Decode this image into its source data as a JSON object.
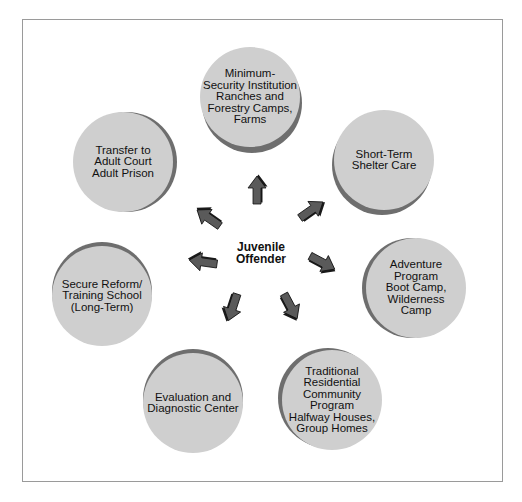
{
  "center": {
    "label": "Juvenile\nOffender"
  },
  "nodes": [
    {
      "id": "minimum-security",
      "label": "Minimum-\nSecurity Institution\nRanches and\nForestry Camps,\nFarms"
    },
    {
      "id": "short-term",
      "label": "Short-Term\nShelter Care"
    },
    {
      "id": "adventure",
      "label": "Adventure\nProgram\nBoot Camp,\nWilderness\nCamp"
    },
    {
      "id": "traditional-residential",
      "label": "Traditional\nResidential\nCommunity\nProgram\nHalfway Houses,\nGroup Homes"
    },
    {
      "id": "evaluation",
      "label": "Evaluation and\nDiagnostic Center"
    },
    {
      "id": "secure-reform",
      "label": "Secure Reform/\nTraining School\n(Long-Term)"
    },
    {
      "id": "transfer-adult",
      "label": "Transfer to\nAdult Court\nAdult Prison"
    }
  ],
  "colors": {
    "circle_face": "#cfcfcf",
    "circle_shadow": "#6e6e6e",
    "arrow": "#5a5a5a",
    "frame": "#9a9a9a"
  }
}
